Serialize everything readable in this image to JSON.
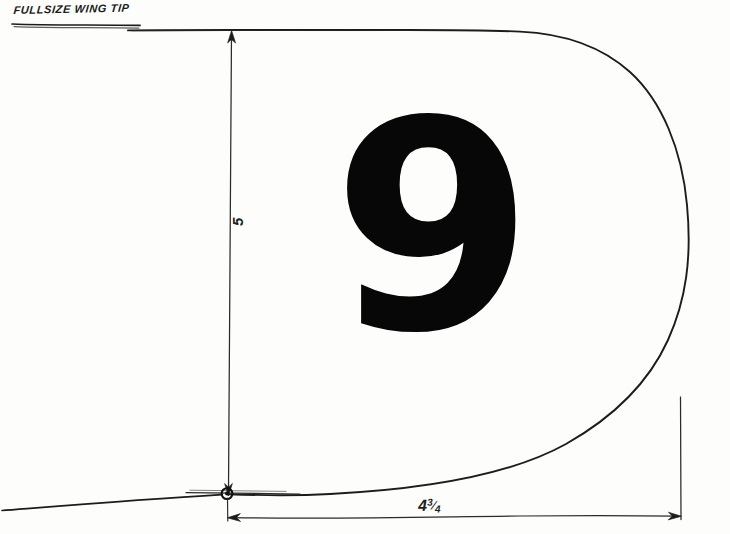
{
  "drawing": {
    "title": "FULLSIZE WING TIP",
    "part_label": "9",
    "paper_color": "#fdfdfc",
    "ink_color": "#1a1a1a",
    "dimensions": {
      "vertical": {
        "label": "5",
        "name": "span-height-dimension",
        "unit_implied": "inches"
      },
      "horizontal": {
        "label": "4",
        "fraction_numerator": "3",
        "fraction_denominator": "4",
        "full_label": "4 3/4",
        "name": "chord-width-dimension",
        "unit_implied": "inches"
      }
    },
    "annotations": {
      "origin_marker": "datum-point",
      "outline": "wing-tip-profile"
    }
  }
}
